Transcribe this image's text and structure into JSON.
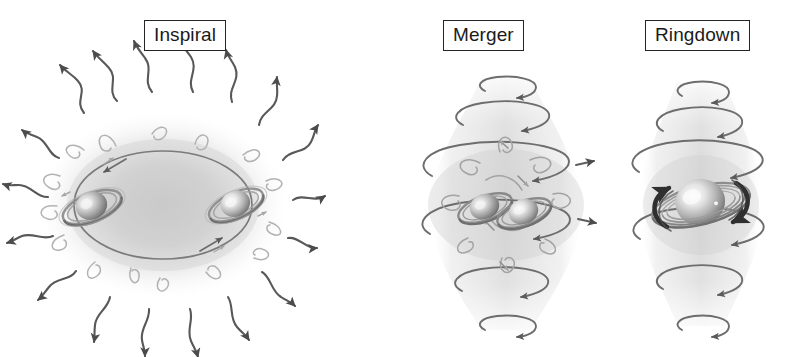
{
  "figure": {
    "background_color": "#ffffff",
    "width": 788,
    "height": 357,
    "style": "grayscale pencil-shaded scientific illustration"
  },
  "palette": {
    "ink": "#4a4a4a",
    "ink_dark": "#2b2b2b",
    "ink_light": "#9a9a9a",
    "ink_faint": "#b8b8b8",
    "cloud": "#cfcfcf",
    "cloud_light": "#e2e2e2",
    "label_border": "#242424",
    "label_text": "#1a1a1a",
    "white": "#ffffff"
  },
  "panels": [
    {
      "id": "inspiral",
      "label": "Inspiral",
      "description": "Two black holes orbiting each other inside a diffuse elliptical cloud, with sinusoidal gravitational-wave arrows radiating outward in all directions.",
      "bodies": 2,
      "wave_arrows": 16,
      "orbit_shape": "ellipse",
      "cloud_shape": "ellipse"
    },
    {
      "id": "merger",
      "label": "Merger",
      "description": "Two black holes colliding at the center of a vertically stacked set of rotating elliptical rings forming an hourglass cloud.",
      "bodies": 2,
      "rings": 6,
      "cloud_shape": "hourglass"
    },
    {
      "id": "ringdown",
      "label": "Ringdown",
      "description": "A single merged, spinning black hole ringing down, surrounded by stacked rotating rings and bold dark curved spin arrows.",
      "bodies": 1,
      "rings": 6,
      "cloud_shape": "hourglass",
      "spin_arrows": 2
    }
  ],
  "icons": {
    "wave_arrow": "wavy-gravitational-wave-arrow",
    "ring_arrow": "rotating-ring-arrow",
    "spin_arrow": "bold-spin-arrow",
    "black_hole": "black-hole-with-accretion-ring"
  }
}
